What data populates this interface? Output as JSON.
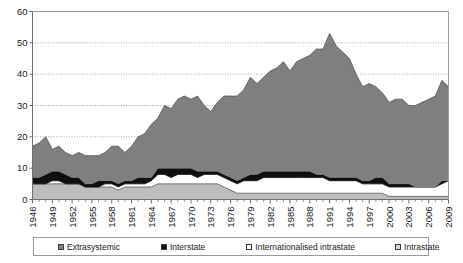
{
  "chart_data": {
    "type": "area",
    "stacked": true,
    "title": "",
    "subtitle": "",
    "xlabel": "",
    "ylabel": "",
    "xlim": [
      1946,
      2009
    ],
    "ylim": [
      0,
      60
    ],
    "yticks": [
      0,
      10,
      20,
      30,
      40,
      50,
      60
    ],
    "xticks": [
      1946,
      1949,
      1952,
      1955,
      1958,
      1961,
      1964,
      1967,
      1970,
      1973,
      1976,
      1979,
      1982,
      1985,
      1988,
      1991,
      1994,
      1997,
      2000,
      2003,
      2006,
      2009
    ],
    "grid": true,
    "grid_axis": "y",
    "legend_position": "bottom",
    "x": [
      1946,
      1947,
      1948,
      1949,
      1950,
      1951,
      1952,
      1953,
      1954,
      1955,
      1956,
      1957,
      1958,
      1959,
      1960,
      1961,
      1962,
      1963,
      1964,
      1965,
      1966,
      1967,
      1968,
      1969,
      1970,
      1971,
      1972,
      1973,
      1974,
      1975,
      1976,
      1977,
      1978,
      1979,
      1980,
      1981,
      1982,
      1983,
      1984,
      1985,
      1986,
      1987,
      1988,
      1989,
      1990,
      1991,
      1992,
      1993,
      1994,
      1995,
      1996,
      1997,
      1998,
      1999,
      2000,
      2001,
      2002,
      2003,
      2004,
      2005,
      2006,
      2007,
      2008,
      2009
    ],
    "series": [
      {
        "name": "Intrastate",
        "color": "#bdbdbd",
        "values": [
          5,
          5,
          5,
          5,
          5,
          5,
          5,
          5,
          4,
          4,
          4,
          4,
          4,
          3,
          4,
          4,
          4,
          4,
          4,
          5,
          5,
          5,
          5,
          5,
          5,
          5,
          5,
          5,
          5,
          4,
          3,
          2,
          2,
          2,
          2,
          2,
          2,
          2,
          2,
          2,
          2,
          2,
          2,
          2,
          2,
          2,
          2,
          2,
          2,
          2,
          2,
          2,
          2,
          2,
          1,
          1,
          1,
          1,
          1,
          1,
          1,
          1,
          1,
          1
        ]
      },
      {
        "name": "Internationalised intrastate",
        "color": "#ffffff",
        "values": [
          0,
          0,
          0,
          1,
          1,
          0,
          0,
          0,
          0,
          0,
          0,
          1,
          1,
          1,
          1,
          1,
          1,
          1,
          2,
          3,
          3,
          2,
          3,
          3,
          3,
          2,
          3,
          3,
          3,
          3,
          3,
          3,
          4,
          4,
          4,
          5,
          5,
          5,
          5,
          5,
          5,
          5,
          5,
          5,
          5,
          4,
          4,
          4,
          4,
          4,
          3,
          3,
          3,
          3,
          3,
          3,
          3,
          3,
          3,
          3,
          3,
          3,
          4,
          5
        ]
      },
      {
        "name": "Interstate",
        "color": "#0f0f0f",
        "values": [
          2,
          2,
          3,
          3,
          3,
          3,
          2,
          2,
          1,
          1,
          2,
          1,
          1,
          1,
          1,
          1,
          2,
          2,
          1,
          2,
          2,
          3,
          2,
          2,
          2,
          2,
          1,
          1,
          1,
          1,
          1,
          1,
          1,
          2,
          2,
          2,
          2,
          2,
          2,
          2,
          2,
          2,
          2,
          1,
          1,
          1,
          1,
          1,
          1,
          1,
          1,
          1,
          2,
          2,
          1,
          1,
          1,
          1,
          0,
          0,
          0,
          0,
          1,
          0
        ]
      },
      {
        "name": "Extrasystemic",
        "color": "#7f7f7f",
        "values": [
          10,
          11,
          12,
          7,
          8,
          7,
          7,
          8,
          9,
          9,
          8,
          9,
          11,
          12,
          9,
          11,
          13,
          14,
          17,
          16,
          20,
          19,
          22,
          23,
          22,
          24,
          21,
          19,
          22,
          25,
          26,
          27,
          28,
          31,
          29,
          30,
          32,
          33,
          35,
          32,
          35,
          36,
          37,
          40,
          40,
          46,
          42,
          40,
          38,
          33,
          30,
          31,
          29,
          27,
          26,
          27,
          27,
          25,
          26,
          27,
          28,
          29,
          32,
          30
        ]
      }
    ],
    "totals": [
      17,
      18,
      20,
      16,
      17,
      15,
      14,
      15,
      14,
      14,
      14,
      15,
      17,
      17,
      15,
      17,
      20,
      21,
      24,
      26,
      30,
      29,
      32,
      33,
      32,
      33,
      30,
      28,
      31,
      33,
      33,
      33,
      35,
      39,
      37,
      39,
      41,
      42,
      44,
      41,
      44,
      45,
      46,
      48,
      48,
      53,
      49,
      47,
      45,
      40,
      36,
      37,
      36,
      34,
      31,
      32,
      32,
      30,
      30,
      31,
      32,
      33,
      38,
      36
    ]
  },
  "legend": {
    "items": [
      {
        "label": "Extrasystemic"
      },
      {
        "label": "Interstate"
      },
      {
        "label": "Internationalised intrastate"
      },
      {
        "label": "Intrastate"
      }
    ]
  }
}
